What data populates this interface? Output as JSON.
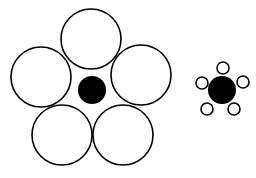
{
  "diagram": {
    "title": "",
    "colors": {
      "background": "#ffffff",
      "stroke": "#000000",
      "fill": "#000000"
    },
    "figures": [
      {
        "name": "large-surround",
        "center": {
          "cx": 92,
          "cy": 90,
          "r": 14,
          "filled": true
        },
        "outer": [
          {
            "cx": 91,
            "cy": 39,
            "r": 30,
            "filled": false
          },
          {
            "cx": 141,
            "cy": 75,
            "r": 30,
            "filled": false
          },
          {
            "cx": 123,
            "cy": 135,
            "r": 30,
            "filled": false
          },
          {
            "cx": 62,
            "cy": 135,
            "r": 30,
            "filled": false
          },
          {
            "cx": 41,
            "cy": 77,
            "r": 30,
            "filled": false
          }
        ]
      },
      {
        "name": "small-surround",
        "center": {
          "cx": 222,
          "cy": 90,
          "r": 14,
          "filled": true
        },
        "outer": [
          {
            "cx": 223,
            "cy": 68,
            "r": 6,
            "filled": false
          },
          {
            "cx": 243,
            "cy": 82,
            "r": 6,
            "filled": false
          },
          {
            "cx": 234,
            "cy": 109,
            "r": 6,
            "filled": false
          },
          {
            "cx": 207,
            "cy": 109,
            "r": 6,
            "filled": false
          },
          {
            "cx": 202,
            "cy": 83,
            "r": 6,
            "filled": false
          }
        ]
      }
    ]
  }
}
